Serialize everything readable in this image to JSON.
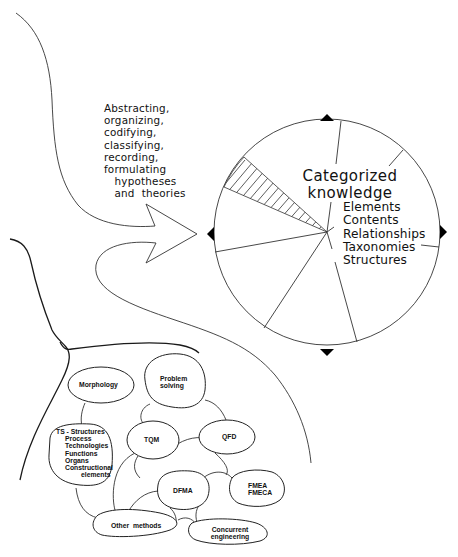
{
  "diagram": {
    "process_label": {
      "lines": [
        "Abstracting,",
        "organizing,",
        "codifying,",
        "classifying,",
        "recording,",
        "formulating",
        "   hypotheses",
        "   and  theories"
      ]
    },
    "knowledge_circle": {
      "title_line1": "Categorized",
      "title_line2": "knowledge",
      "items": [
        "Elements",
        "Contents",
        "Relationships",
        "Taxonomies",
        "Structures"
      ]
    },
    "methods": {
      "morphology": "Morphology",
      "problem_solving_1": "Problem",
      "problem_solving_2": "solving",
      "ts_structures": [
        "TS - Structures",
        "Process",
        "Technologies",
        "Functions",
        "Organs",
        "Constructional",
        "elements"
      ],
      "tqm": "TQM",
      "qfd": "QFD",
      "dfma": "DFMA",
      "fmea_1": "FMEA",
      "fmea_2": "FMECA",
      "other_methods": "Other  methods",
      "concurrent_1": "Concurrent",
      "concurrent_2": "engineering"
    },
    "colors": {
      "line": "#333333",
      "background": "#ffffff",
      "marker": "#000000"
    }
  }
}
